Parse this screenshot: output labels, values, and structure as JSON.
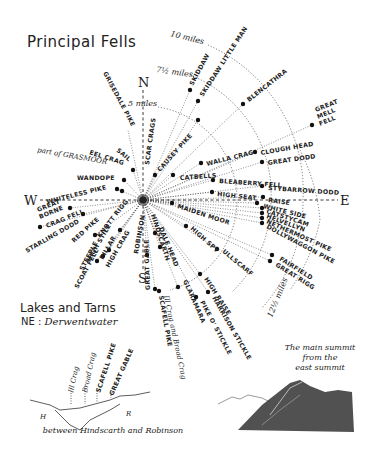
{
  "header": {
    "title": "Principal Fells"
  },
  "compass": {
    "north": "N",
    "south": "S",
    "east": "E",
    "west": "W"
  },
  "distance_rings": [
    {
      "label": "5 miles"
    },
    {
      "label": "7½ miles"
    },
    {
      "label": "10 miles"
    },
    {
      "label": "12½ miles"
    }
  ],
  "fells": [
    "SKIDDAW",
    "SKIDDAW LITTLE MAN",
    "BLENCATHRA",
    "GREAT MELL FELL",
    "CLOUGH HEAD",
    "GREAT DODD",
    "WALLA CRAG",
    "CATBELLS",
    "BLEABERRY FELL",
    "STYBARROW DODD",
    "HIGH SEAT",
    "RAISE",
    "WHITE SIDE",
    "CATSTYCAM",
    "HELVELLYN",
    "NETHERMOST PIKE",
    "DOLLYWAGGON PIKE",
    "FAIRFIELD",
    "GREAT RIGG",
    "MAIDEN MOOR",
    "HIGH SPY",
    "ULLSCARF",
    "HIGH RAISE",
    "HARRISON STICKLE",
    "PIKE O' STICKLE",
    "GLARAMARA",
    "DALE HEAD",
    "HINDSCARTH",
    "GREAT GABLE",
    "SCAFELL PIKE",
    "Ill Crag and Broad Crag",
    "ROBINSON",
    "HIGH CRAG",
    "PILLAR",
    "HIGH STILE",
    "KNOTT RIGG",
    "STEEPLE",
    "SCOAT FELL",
    "RED PIKE",
    "STARLING DODD",
    "CRAG FELL",
    "GREAT BORNE",
    "WHITELESS PIKE",
    "WANDOPE",
    "part of GRASMOOR",
    "EEL CRAG",
    "SAIL",
    "GRISEDALE PIKE",
    "SCAR CRAGS",
    "CAUSEY PIKE"
  ],
  "labels": {
    "skiddaw": "SKIDDAW",
    "skiddaw_little_man": "SKIDDAW LITTLE MAN",
    "blencathra": "BLENCATHRA",
    "great_mell_fell_1": "GREAT",
    "great_mell_fell_2": "MELL",
    "great_mell_fell_3": "FELL",
    "clough_head": "CLOUGH HEAD",
    "great_dodd": "GREAT DODD",
    "walla_crag": "WALLA CRAG",
    "catbells": "CATBELLS",
    "bleaberry_fell": "BLEABERRY FELL",
    "stybarrow_dodd": "STYBARROW DODD",
    "high_seat": "HIGH SEAT",
    "raise": "RAISE",
    "white_side": "WHITE SIDE",
    "catstycam": "CATSTYCAM",
    "helvellyn": "HELVELLYN",
    "nethermost_pike": "NETHERMOST PIKE",
    "dollywaggon_pike": "DOLLYWAGGON PIKE",
    "fairfield": "FAIRFIELD",
    "great_rigg": "GREAT RIGG",
    "maiden_moor": "MAIDEN MOOR",
    "high_spy": "HIGH SPY",
    "ullscarf": "ULLSCARF",
    "high_raise": "HIGH RAISE",
    "harrison_stickle": "HARRISON STICKLE",
    "pike_o_stickle": "PIKE O' STICKLE",
    "glaramara": "GLARAMARA",
    "dale_head": "DALE HEAD",
    "hindscarth": "HINDSCARTH",
    "great_gable": "GREAT GABLE",
    "scafell_pike": "SCAFELL PIKE",
    "ill_crag_broad_crag": "Ill Crag and Broad Crag",
    "robinson": "ROBINSON",
    "high_crag": "HIGH CRAG",
    "pillar": "PILLAR",
    "high_stile": "HIGH STILE",
    "knott_rigg": "KNOTT RIGG",
    "steeple": "STEEPLE",
    "scoat_fell": "SCOAT FELL",
    "red_pike": "RED PIKE",
    "starling_dodd": "STARLING DODD",
    "crag_fell": "CRAG FELL",
    "great_borne_1": "GREAT",
    "great_borne_2": "BORNE",
    "whiteless_pike": "WHITELESS PIKE",
    "wandope": "WANDOPE",
    "part_of_grasmoor": "part of GRASMOOR",
    "eel_crag": "EEL CRAG",
    "sail": "SAIL",
    "grisedale_pike": "GRISEDALE PIKE",
    "scar_crags": "SCAR CRAGS",
    "causey_pike": "CAUSEY PIKE"
  },
  "lakes": {
    "title": "Lakes and Tarns",
    "prefix": "NE :",
    "value": "Derwentwater"
  },
  "sketch_left": {
    "caption": "between Hindscarth and Robinson",
    "marker_h": "H",
    "marker_r": "R",
    "peaks": [
      "Ill Crag",
      "Broad Crag",
      "SCAFELL PIKE",
      "GREAT GABLE"
    ]
  },
  "sketch_right": {
    "caption_line1": "The main summit",
    "caption_line2": "from the",
    "caption_line3": "east summit"
  },
  "colors": {
    "ink": "#222222",
    "paper": "#ffffff"
  }
}
